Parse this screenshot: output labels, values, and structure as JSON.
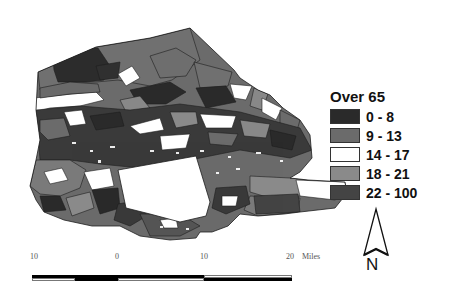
{
  "map": {
    "type": "choropleth",
    "legend": {
      "title": "Over 65",
      "classes": [
        {
          "label": "0 - 8",
          "color": "#2a2a2a"
        },
        {
          "label": "9 - 13",
          "color": "#6b6b6b"
        },
        {
          "label": "14 - 17",
          "color": "#ffffff"
        },
        {
          "label": "18 - 21",
          "color": "#8a8a8a"
        },
        {
          "label": "22 - 100",
          "color": "#444444"
        }
      ]
    },
    "scale_bar": {
      "ticks": [
        "10",
        "0",
        "10",
        "20"
      ],
      "unit": "Miles"
    },
    "north_arrow": {
      "label": "N"
    }
  },
  "colors": {
    "c1": "#2a2a2a",
    "c2": "#6b6b6b",
    "c3": "#ffffff",
    "c4": "#8a8a8a",
    "c5": "#444444",
    "border": "#1e1e1e"
  }
}
